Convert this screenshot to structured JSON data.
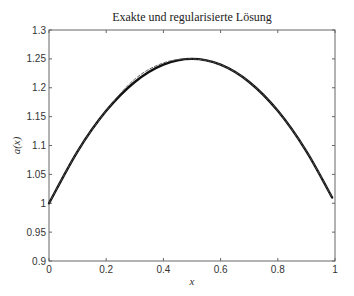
{
  "chart_data": {
    "type": "line",
    "title": "Exakte und regularisierte Lösung",
    "xlabel": "x",
    "ylabel": "a(x)",
    "xlim": [
      0,
      1
    ],
    "ylim": [
      0.9,
      1.3
    ],
    "xticks": [
      "0",
      "0.2",
      "0.4",
      "0.6",
      "0.8",
      "1"
    ],
    "yticks": [
      "0.9",
      "0.95",
      "1",
      "1.05",
      "1.1",
      "1.15",
      "1.2",
      "1.25",
      "1.3"
    ],
    "grid": false,
    "legend": null,
    "series": [
      {
        "name": "exakte Lösung",
        "style": "solid-thick",
        "x": [
          0,
          0.1,
          0.2,
          0.3,
          0.4,
          0.5,
          0.6,
          0.7,
          0.8,
          0.9,
          0.99
        ],
        "values": [
          1.0,
          1.09,
          1.16,
          1.21,
          1.24,
          1.25,
          1.24,
          1.21,
          1.16,
          1.09,
          1.01
        ]
      },
      {
        "name": "regularisierte Lösung",
        "style": "dashed-thin",
        "x": [
          0,
          0.1,
          0.2,
          0.3,
          0.4,
          0.5,
          0.6,
          0.7,
          0.8,
          0.9,
          0.99
        ],
        "values": [
          1.0,
          1.09,
          1.16,
          1.215,
          1.243,
          1.25,
          1.24,
          1.21,
          1.16,
          1.09,
          1.01
        ]
      }
    ]
  }
}
